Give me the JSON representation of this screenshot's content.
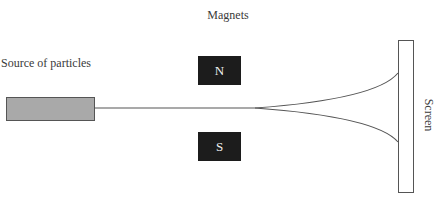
{
  "labels": {
    "magnets": "Magnets",
    "source": "Source of particles",
    "screen": "Screen"
  },
  "magnets": {
    "north": "N",
    "south": "S"
  },
  "colors": {
    "source_fill": "#a9a9a9",
    "magnet_fill": "#1c1c1c",
    "line": "#555555"
  }
}
